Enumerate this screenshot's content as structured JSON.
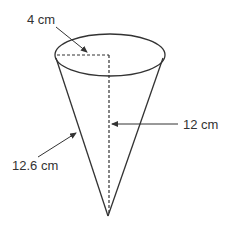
{
  "diagram": {
    "type": "cone",
    "labels": {
      "radius": "4 cm",
      "height": "12 cm",
      "slant_height": "12.6 cm"
    },
    "colors": {
      "stroke": "#333333",
      "background": "#ffffff"
    }
  }
}
